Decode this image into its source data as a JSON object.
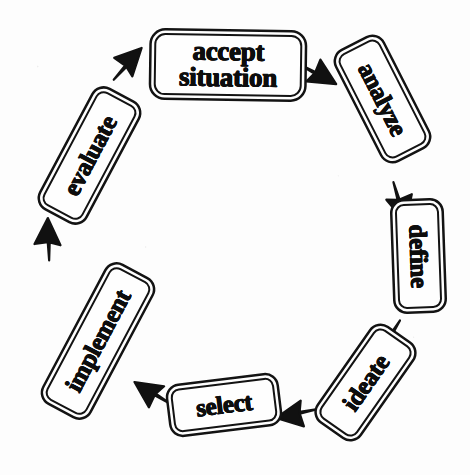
{
  "diagram": {
    "type": "circular-process-cycle",
    "style": "hand-drawn black and white",
    "background_color": "#fdfdfd",
    "ink_color": "#0d0d0d",
    "step_count": 7,
    "direction": "clockwise",
    "steps": [
      {
        "id": "accept-situation",
        "label_line1": "accept",
        "label_line2": "situation",
        "order": 1,
        "position": "top"
      },
      {
        "id": "analyze",
        "label_line1": "analyze",
        "label_line2": "",
        "order": 2,
        "position": "upper-right"
      },
      {
        "id": "define",
        "label_line1": "define",
        "label_line2": "",
        "order": 3,
        "position": "right"
      },
      {
        "id": "ideate",
        "label_line1": "ideate",
        "label_line2": "",
        "order": 4,
        "position": "lower-right"
      },
      {
        "id": "select",
        "label_line1": "select",
        "label_line2": "",
        "order": 5,
        "position": "bottom"
      },
      {
        "id": "implement",
        "label_line1": "implement",
        "label_line2": "",
        "order": 6,
        "position": "lower-left"
      },
      {
        "id": "evaluate",
        "label_line1": "evaluate",
        "label_line2": "",
        "order": 7,
        "position": "upper-left"
      }
    ],
    "arrows": [
      {
        "id": "evaluate-to-accept",
        "from": "evaluate",
        "to": "accept-situation"
      },
      {
        "id": "accept-to-analyze",
        "from": "accept-situation",
        "to": "analyze"
      },
      {
        "id": "analyze-to-define",
        "from": "analyze",
        "to": "define"
      },
      {
        "id": "define-to-ideate",
        "from": "define",
        "to": "ideate"
      },
      {
        "id": "ideate-to-select",
        "from": "ideate",
        "to": "select"
      },
      {
        "id": "select-to-implement",
        "from": "select",
        "to": "implement"
      },
      {
        "id": "implement-to-evaluate",
        "from": "implement",
        "to": "evaluate"
      }
    ]
  }
}
